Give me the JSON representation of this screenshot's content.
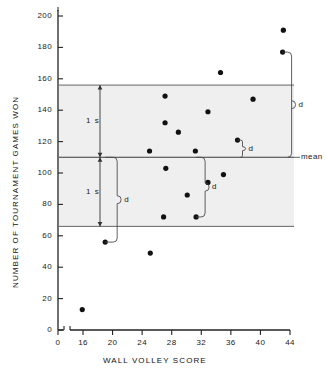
{
  "chart_data": {
    "type": "scatter",
    "title": "",
    "xlabel": "WALL VOLLEY SCORE",
    "ylabel": "NUMBER OF TOURNAMENT GAMES WON",
    "xlim": [
      14,
      44
    ],
    "ylim": [
      0,
      208
    ],
    "x_axis_break": true,
    "x_origin_label": "0",
    "xticks": [
      16,
      20,
      24,
      28,
      32,
      36,
      40,
      44
    ],
    "xtick_labels": [
      "16",
      "20",
      "24",
      "28",
      "32",
      "36",
      "40",
      "44"
    ],
    "yticks": [
      0,
      20,
      40,
      60,
      80,
      100,
      120,
      140,
      160,
      180,
      200
    ],
    "ytick_labels": [
      "0",
      "20",
      "40",
      "60",
      "80",
      "100",
      "120",
      "140",
      "160",
      "180",
      "200"
    ],
    "grid": false,
    "legend": "none",
    "marker": "filled-circle",
    "marker_color": "#111111",
    "band_fill": "#efefef",
    "line_color": "#555555",
    "points": [
      {
        "x": 15.9,
        "y": 13
      },
      {
        "x": 19.0,
        "y": 56
      },
      {
        "x": 25.1,
        "y": 49
      },
      {
        "x": 25.0,
        "y": 114
      },
      {
        "x": 27.1,
        "y": 149
      },
      {
        "x": 27.1,
        "y": 132
      },
      {
        "x": 27.2,
        "y": 103
      },
      {
        "x": 26.9,
        "y": 72
      },
      {
        "x": 28.9,
        "y": 126
      },
      {
        "x": 30.1,
        "y": 86
      },
      {
        "x": 31.2,
        "y": 114
      },
      {
        "x": 31.3,
        "y": 72
      },
      {
        "x": 32.9,
        "y": 139
      },
      {
        "x": 32.9,
        "y": 94
      },
      {
        "x": 34.6,
        "y": 164
      },
      {
        "x": 35.0,
        "y": 99
      },
      {
        "x": 36.9,
        "y": 121
      },
      {
        "x": 39.0,
        "y": 147
      },
      {
        "x": 43.1,
        "y": 191
      },
      {
        "x": 43.0,
        "y": 177
      }
    ],
    "reference_lines": [
      {
        "name": "upper-1s",
        "value": 156,
        "label": ""
      },
      {
        "name": "mean",
        "value": 110,
        "label": "mean"
      },
      {
        "name": "lower-1s",
        "value": 66,
        "label": ""
      }
    ],
    "bands": [
      {
        "name": "upper-band",
        "from": 110,
        "to": 156
      },
      {
        "name": "lower-band",
        "from": 66,
        "to": 110
      }
    ],
    "annotations": {
      "sd_upper_label": "1 s",
      "sd_lower_label": "1 s",
      "mean_label": "mean",
      "deviation_label": "d",
      "deviation_brackets": [
        {
          "name": "d-far-upper",
          "from_y": 177,
          "to_y": 110,
          "at_x": 43.0
        },
        {
          "name": "d-small-upper",
          "from_y": 121,
          "to_y": 110,
          "at_x": 36.9
        },
        {
          "name": "d-left-lower",
          "from_y": 110,
          "to_y": 56,
          "at_x": 19.0
        },
        {
          "name": "d-mid-lower",
          "from_y": 110,
          "to_y": 72,
          "at_x": 31.3
        }
      ]
    }
  }
}
